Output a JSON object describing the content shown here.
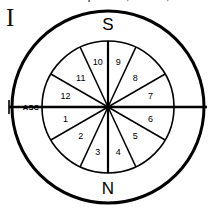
{
  "figure": {
    "numeral": "I",
    "truncated_caption": "p entrance, like a seat,",
    "background_color": "#ffffff",
    "line_color": "#000000"
  },
  "cardinals": {
    "south": "S",
    "north": "N"
  },
  "axis": {
    "ascendant_label": "ASC"
  },
  "chart_data": {
    "type": "pie",
    "xlabel": "",
    "ylabel": "",
    "legend_position": "none",
    "grid": false,
    "center": {
      "x": 108,
      "y": 107
    },
    "outer_radius": 96,
    "inner_radius": 66,
    "categories": [
      "1",
      "2",
      "3",
      "4",
      "5",
      "6",
      "7",
      "8",
      "9",
      "10",
      "11",
      "12"
    ],
    "values": [
      30,
      35,
      25,
      25,
      35,
      30,
      30,
      35,
      25,
      25,
      35,
      30
    ],
    "annotations": [
      "S",
      "N",
      "ASC",
      "I"
    ],
    "houses": [
      {
        "number": "1",
        "start_deg": 180,
        "end_deg": 210,
        "label_deg": 195,
        "label_radius": 44
      },
      {
        "number": "2",
        "start_deg": 210,
        "end_deg": 245,
        "label_deg": 227,
        "label_radius": 40
      },
      {
        "number": "3",
        "start_deg": 245,
        "end_deg": 270,
        "label_deg": 257,
        "label_radius": 46
      },
      {
        "number": "4",
        "start_deg": 270,
        "end_deg": 295,
        "label_deg": 283,
        "label_radius": 46
      },
      {
        "number": "5",
        "start_deg": 295,
        "end_deg": 330,
        "label_deg": 313,
        "label_radius": 40
      },
      {
        "number": "6",
        "start_deg": 330,
        "end_deg": 360,
        "label_deg": 345,
        "label_radius": 44
      },
      {
        "number": "7",
        "start_deg": 0,
        "end_deg": 30,
        "label_deg": 15,
        "label_radius": 44
      },
      {
        "number": "8",
        "start_deg": 30,
        "end_deg": 65,
        "label_deg": 47,
        "label_radius": 40
      },
      {
        "number": "9",
        "start_deg": 65,
        "end_deg": 90,
        "label_deg": 77,
        "label_radius": 46
      },
      {
        "number": "10",
        "start_deg": 90,
        "end_deg": 115,
        "label_deg": 103,
        "label_radius": 46
      },
      {
        "number": "11",
        "start_deg": 115,
        "end_deg": 150,
        "label_deg": 133,
        "label_radius": 40
      },
      {
        "number": "12",
        "start_deg": 150,
        "end_deg": 180,
        "label_deg": 165,
        "label_radius": 44
      }
    ]
  }
}
